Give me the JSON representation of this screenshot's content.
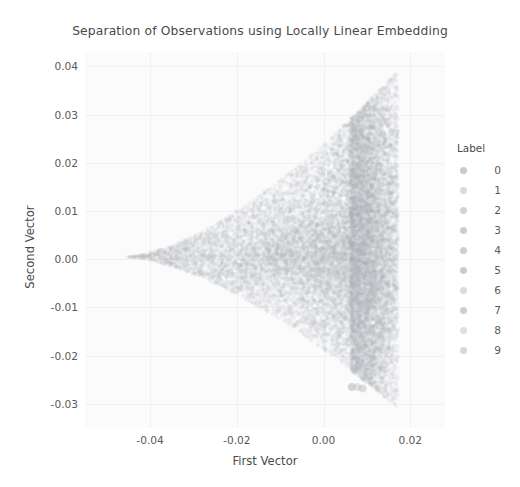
{
  "chart_data": {
    "type": "scatter",
    "title": "Separation of Observations using Locally Linear Embedding",
    "xlabel": "First Vector",
    "ylabel": "Second Vector",
    "xlim": [
      -0.055,
      0.028
    ],
    "ylim": [
      -0.035,
      0.043
    ],
    "xticks": [
      -0.04,
      -0.02,
      0.0,
      0.02
    ],
    "xticklabels": [
      "-0.04",
      "-0.02",
      "0.00",
      "0.02"
    ],
    "yticks": [
      0.04,
      0.03,
      0.02,
      0.01,
      0.0,
      -0.01,
      -0.02,
      -0.03
    ],
    "yticklabels": [
      "0.04",
      "0.03",
      "0.02",
      "0.01",
      "0.00",
      "-0.01",
      "-0.02",
      "-0.03"
    ],
    "grid": true,
    "grid_color": "#f1f1f3",
    "plot_bgcolor": "#fbfbfc",
    "legend": {
      "title": "Label",
      "position": "right",
      "entries": [
        {
          "label": "0",
          "color": "#9aa0a6"
        },
        {
          "label": "1",
          "color": "#b9bcc0"
        },
        {
          "label": "2",
          "color": "#a9aeb3"
        },
        {
          "label": "3",
          "color": "#9ea4aa"
        },
        {
          "label": "4",
          "color": "#a4a9af"
        },
        {
          "label": "5",
          "color": "#9ca2a8"
        },
        {
          "label": "6",
          "color": "#bcc0c4"
        },
        {
          "label": "7",
          "color": "#a1a7ad"
        },
        {
          "label": "8",
          "color": "#c2c5c9"
        },
        {
          "label": "9",
          "color": "#b4b8bc"
        }
      ]
    },
    "series": [
      {
        "name": "0",
        "color": "#9aa0a6",
        "n_points": 700,
        "cluster_center": [
          0.01,
          0.021
        ],
        "cluster_spread": [
          0.005,
          0.01
        ]
      },
      {
        "name": "1",
        "color": "#b9bcc0",
        "n_points": 700,
        "cluster_center": [
          0.012,
          -0.014
        ],
        "cluster_spread": [
          0.004,
          0.009
        ]
      },
      {
        "name": "2",
        "color": "#a9aeb3",
        "n_points": 700,
        "cluster_center": [
          0.002,
          0.004
        ],
        "cluster_spread": [
          0.009,
          0.007
        ]
      },
      {
        "name": "3",
        "color": "#9ea4aa",
        "n_points": 700,
        "cluster_center": [
          0.006,
          -0.004
        ],
        "cluster_spread": [
          0.008,
          0.008
        ]
      },
      {
        "name": "4",
        "color": "#a4a9af",
        "n_points": 700,
        "cluster_center": [
          -0.006,
          0.001
        ],
        "cluster_spread": [
          0.011,
          0.004
        ]
      },
      {
        "name": "5",
        "color": "#9ca2a8",
        "n_points": 700,
        "cluster_center": [
          0.004,
          0.009
        ],
        "cluster_spread": [
          0.009,
          0.008
        ]
      },
      {
        "name": "6",
        "color": "#bcc0c4",
        "n_points": 700,
        "cluster_center": [
          -0.014,
          0.0
        ],
        "cluster_spread": [
          0.013,
          0.003
        ]
      },
      {
        "name": "7",
        "color": "#a1a7ad",
        "n_points": 700,
        "cluster_center": [
          0.011,
          0.006
        ],
        "cluster_spread": [
          0.005,
          0.012
        ]
      },
      {
        "name": "8",
        "color": "#c2c5c9",
        "n_points": 700,
        "cluster_center": [
          -0.002,
          -0.002
        ],
        "cluster_spread": [
          0.01,
          0.006
        ]
      },
      {
        "name": "9",
        "color": "#b4b8bc",
        "n_points": 700,
        "cluster_center": [
          0.008,
          -0.008
        ],
        "cluster_spread": [
          0.007,
          0.009
        ]
      }
    ],
    "outliers": [
      {
        "x": 0.0065,
        "y": -0.0265
      },
      {
        "x": 0.0078,
        "y": -0.0265
      },
      {
        "x": 0.009,
        "y": -0.0268
      }
    ]
  }
}
